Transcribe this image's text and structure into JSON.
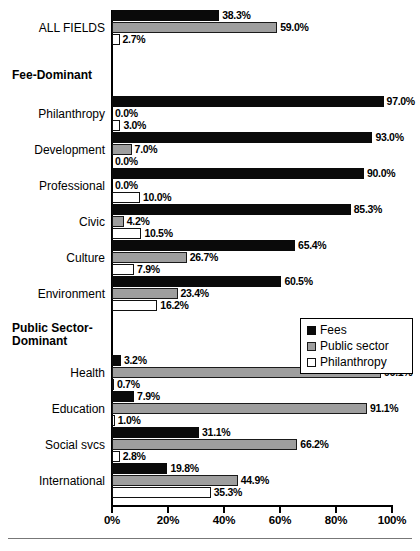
{
  "chart_data": {
    "type": "bar",
    "orientation": "horizontal",
    "title": "",
    "xlabel": "",
    "ylabel": "",
    "xlim": [
      0,
      100
    ],
    "xticks": [
      0,
      20,
      40,
      60,
      80,
      100
    ],
    "xtick_labels": [
      "0%",
      "20%",
      "40%",
      "60%",
      "80%",
      "100%"
    ],
    "grid": false,
    "legend_position": "center-right",
    "value_suffix": "%",
    "series": [
      {
        "name": "Fees",
        "color": "#0a0a0a",
        "values": [
          38.3,
          97.0,
          93.0,
          90.0,
          85.3,
          65.4,
          60.5,
          3.2,
          7.9,
          31.1,
          19.8
        ]
      },
      {
        "name": "Public sector",
        "color": "#9e9e9e",
        "values": [
          59.0,
          0.0,
          7.0,
          0.0,
          4.2,
          26.7,
          23.4,
          96.1,
          91.1,
          66.2,
          44.9
        ]
      },
      {
        "name": "Philanthropy",
        "color": "#ffffff",
        "values": [
          2.7,
          3.0,
          0.0,
          10.0,
          10.5,
          7.9,
          16.2,
          0.7,
          1.0,
          2.8,
          35.3
        ]
      }
    ],
    "categories": [
      "ALL FIELDS",
      "Philanthropy",
      "Development",
      "Professional",
      "Civic",
      "Culture",
      "Environment",
      "Health",
      "Education",
      "Social svcs",
      "International"
    ],
    "value_labels": [
      [
        "38.3%",
        "59.0%",
        "2.7%"
      ],
      [
        "97.0%",
        "0.0%",
        "3.0%"
      ],
      [
        "93.0%",
        "7.0%",
        "0.0%"
      ],
      [
        "90.0%",
        "0.0%",
        "10.0%"
      ],
      [
        "85.3%",
        "4.2%",
        "10.5%"
      ],
      [
        "65.4%",
        "26.7%",
        "7.9%"
      ],
      [
        "60.5%",
        "23.4%",
        "16.2%"
      ],
      [
        "3.2%",
        "96.1%",
        "0.7%"
      ],
      [
        "7.9%",
        "91.1%",
        "1.0%"
      ],
      [
        "31.1%",
        "66.2%",
        "2.8%"
      ],
      [
        "19.8%",
        "44.9%",
        "35.3%"
      ]
    ],
    "section_headers": [
      "Fee-Dominant",
      "Public Sector-Dominant"
    ],
    "legend_entries": [
      "Fees",
      "Public sector",
      "Philanthropy"
    ]
  },
  "legend": {
    "items": [
      {
        "label": "Fees",
        "swatch": "fees"
      },
      {
        "label": "Public sector",
        "swatch": "public"
      },
      {
        "label": "Philanthropy",
        "swatch": "phil"
      }
    ]
  },
  "sections": {
    "fee_dominant": "Fee-Dominant",
    "public_sector_dominant_line1": "Public Sector-",
    "public_sector_dominant_line2": "Dominant"
  },
  "axis": {
    "ticks": [
      "0%",
      "20%",
      "40%",
      "60%",
      "80%",
      "100%"
    ]
  }
}
